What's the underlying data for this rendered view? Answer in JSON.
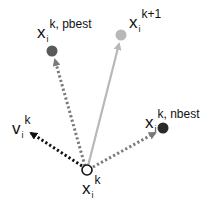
{
  "diagram": {
    "type": "particle-swarm-velocity-update",
    "colors": {
      "pbest_point": "#5a5a5a",
      "next_point": "#b8b8b8",
      "nbest_point": "#2a2a2a",
      "velocity_arrow": "#111111",
      "pbest_arrow": "#7a7a7a",
      "nbest_arrow": "#7a7a7a",
      "update_arrow": "#b8b8b8",
      "origin_stroke": "#111111"
    },
    "labels": {
      "pbest": {
        "base": "x",
        "sub": "i",
        "sup": "k, pbest"
      },
      "next": {
        "base": "x",
        "sub": "i",
        "sup": "k+1"
      },
      "nbest": {
        "base": "x",
        "sub": "i",
        "sup": "k, nbest"
      },
      "velocity": {
        "base": "v",
        "sub": "i",
        "sup": "k"
      },
      "current": {
        "base": "x",
        "sub": "i",
        "sup": "k"
      }
    }
  }
}
